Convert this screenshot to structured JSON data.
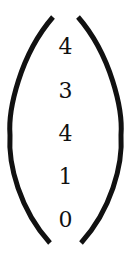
{
  "vector": {
    "entries": [
      "4",
      "3",
      "4",
      "1",
      "0"
    ]
  }
}
